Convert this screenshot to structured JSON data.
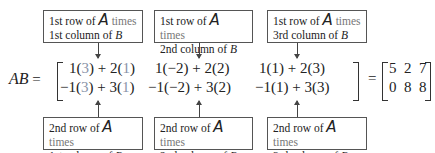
{
  "top_boxes": [
    {
      "row": "1st row of ",
      "A": "A",
      "times": " times",
      "col": "1st column of ",
      "B": "B"
    },
    {
      "row": "1st row of ",
      "A": "A",
      "times": " times",
      "col": "2nd column of ",
      "B": "B"
    },
    {
      "row": "1st row of ",
      "A": "A",
      "times": " times",
      "col": "3rd column of ",
      "B": "B"
    }
  ],
  "bottom_boxes": [
    {
      "row": "2nd row of ",
      "A": "A",
      "times": " times",
      "col": "1st column of ",
      "B": "B"
    },
    {
      "row": "2nd row of ",
      "A": "A",
      "times": " times",
      "col": "2nd column of ",
      "B": "B"
    },
    {
      "row": "2nd row of ",
      "A": "A",
      "times": " times",
      "col": "3rd column of ",
      "B": "B"
    }
  ],
  "equation": {
    "lhs": "AB",
    "equals": "=",
    "equals2": "=",
    "rows": [
      [
        {
          "a1": "1(",
          "b1": "3",
          "m": ") + 2(",
          "b2": "1",
          "e": ")"
        },
        {
          "a1": "1(",
          "b1": "−2",
          "m": ") + 2(",
          "b2": "2",
          "e": ")"
        },
        {
          "a1": "1(",
          "b1": "1",
          "m": ") + 2(",
          "b2": "3",
          "e": ")"
        }
      ],
      [
        {
          "a1": "−1(",
          "b1": "3",
          "m": ") + 3(",
          "b2": "1",
          "e": ")"
        },
        {
          "a1": "−1(",
          "b1": "−2",
          "m": ") + 3(",
          "b2": "2",
          "e": ")"
        },
        {
          "a1": "−1(",
          "b1": "1",
          "m": ") + 3(",
          "b2": "3",
          "e": ")"
        }
      ]
    ],
    "result": [
      [
        "5",
        "2",
        "7"
      ],
      [
        "0",
        "8",
        "8"
      ]
    ]
  }
}
